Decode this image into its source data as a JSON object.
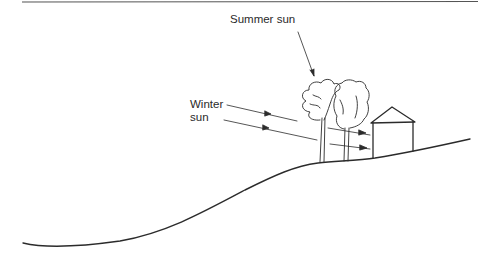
{
  "figure": {
    "type": "illustration",
    "labels": {
      "summer_sun": "Summer sun",
      "winter_sun_line1": "Winter",
      "winter_sun_line2": "sun"
    },
    "elements": [
      "top-rule",
      "hillside",
      "tree-left",
      "tree-right",
      "house",
      "summer-sun-ray",
      "winter-sun-ray-upper",
      "winter-sun-ray-lower"
    ],
    "colors": {
      "ink": "#2b2b2b",
      "background": "#ffffff"
    }
  }
}
